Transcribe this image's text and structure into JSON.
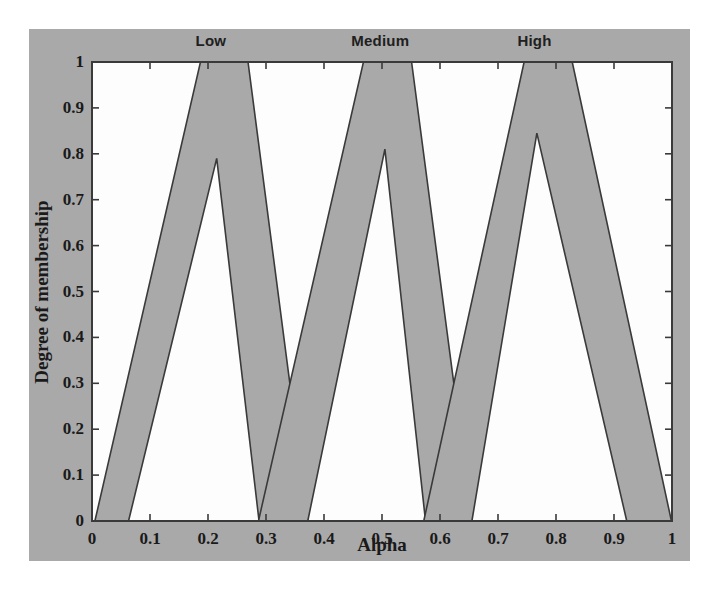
{
  "figure": {
    "background_color": "#ffffff",
    "panel_color": "#a9a9a9",
    "axes_color": "#ffffff",
    "line_color": "#3a3a3a",
    "fill_color": "#a9a9a9"
  },
  "chart_data": {
    "type": "area",
    "title": "",
    "xlabel": "Alpha",
    "ylabel": "Degree of membership",
    "xlim": [
      0,
      1
    ],
    "ylim": [
      0,
      1
    ],
    "grid": false,
    "legend_position": "top-inside",
    "xticks": [
      0,
      0.1,
      0.2,
      0.3,
      0.4,
      0.5,
      0.6,
      0.7,
      0.8,
      0.9,
      1
    ],
    "xtick_labels": [
      "0",
      "0.1",
      "0.2",
      "0.3",
      "0.4",
      "0.5",
      "0.6",
      "0.7",
      "0.8",
      "0.9",
      "1"
    ],
    "yticks": [
      0,
      0.1,
      0.2,
      0.3,
      0.4,
      0.5,
      0.6,
      0.7,
      0.8,
      0.9,
      1
    ],
    "ytick_labels": [
      "0",
      "0.1",
      "0.2",
      "0.3",
      "0.4",
      "0.5",
      "0.6",
      "0.7",
      "0.8",
      "0.9",
      "1"
    ],
    "series": [
      {
        "name": "Low",
        "label_x": 0.205,
        "outer": [
          [
            0.005,
            0.0
          ],
          [
            0.187,
            1.0
          ],
          [
            0.269,
            1.0
          ],
          [
            0.372,
            0.0
          ]
        ],
        "inner": [
          [
            0.063,
            0.0
          ],
          [
            0.215,
            0.79
          ],
          [
            0.288,
            0.0
          ]
        ]
      },
      {
        "name": "Medium",
        "label_x": 0.497,
        "outer": [
          [
            0.287,
            0.0
          ],
          [
            0.468,
            1.0
          ],
          [
            0.551,
            1.0
          ],
          [
            0.655,
            0.0
          ]
        ],
        "inner": [
          [
            0.372,
            0.0
          ],
          [
            0.505,
            0.81
          ],
          [
            0.575,
            0.0
          ]
        ]
      },
      {
        "name": "High",
        "label_x": 0.763,
        "outer": [
          [
            0.572,
            0.0
          ],
          [
            0.745,
            1.0
          ],
          [
            0.828,
            1.0
          ],
          [
            0.999,
            0.0
          ]
        ],
        "inner": [
          [
            0.655,
            0.0
          ],
          [
            0.767,
            0.845
          ],
          [
            0.922,
            0.0
          ]
        ]
      }
    ]
  },
  "labels": {
    "low": "Low",
    "medium": "Medium",
    "high": "High",
    "xaxis": "Alpha",
    "yaxis": "Degree of membership"
  }
}
